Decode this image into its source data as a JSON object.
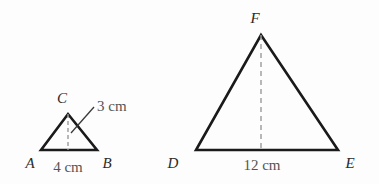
{
  "figure": {
    "background_color": "#fdfdfd",
    "stroke_color": "#1a1a1a",
    "dash_color": "#9a9a9a",
    "leader_color": "#3a3a3a",
    "label_color": "#2b2b2b",
    "measure_color": "#545454",
    "triangles": [
      {
        "name": "small-triangle-abc",
        "vertices": {
          "A": {
            "label": "A",
            "x": 41,
            "y": 150
          },
          "B": {
            "label": "B",
            "x": 97,
            "y": 150
          },
          "C": {
            "label": "C",
            "x": 68,
            "y": 114
          }
        },
        "vertex_label_positions": {
          "A": {
            "x": 30,
            "y": 168
          },
          "B": {
            "x": 107,
            "y": 168
          },
          "C": {
            "x": 62,
            "y": 103
          }
        },
        "altitude": {
          "from_x": 68,
          "from_y": 114,
          "to_x": 68,
          "to_y": 150,
          "style": "dashed"
        },
        "measures": {
          "base": {
            "text": "4 cm",
            "x": 68,
            "y": 172
          },
          "height": {
            "text": "3 cm",
            "x": 97,
            "y": 111
          }
        },
        "leader_line": {
          "x1": 71,
          "y1": 133,
          "x2": 94,
          "y2": 107
        }
      },
      {
        "name": "large-triangle-def",
        "vertices": {
          "D": {
            "label": "D",
            "x": 196,
            "y": 150
          },
          "E": {
            "label": "E",
            "x": 338,
            "y": 150
          },
          "F": {
            "label": "F",
            "x": 261,
            "y": 35
          }
        },
        "vertex_label_positions": {
          "D": {
            "x": 173,
            "y": 168
          },
          "E": {
            "x": 350,
            "y": 168
          },
          "F": {
            "x": 255,
            "y": 23
          }
        },
        "altitude": {
          "from_x": 261,
          "from_y": 35,
          "to_x": 261,
          "to_y": 150,
          "style": "dashed"
        },
        "measures": {
          "base": {
            "text": "12 cm",
            "x": 262,
            "y": 170
          }
        }
      }
    ]
  }
}
